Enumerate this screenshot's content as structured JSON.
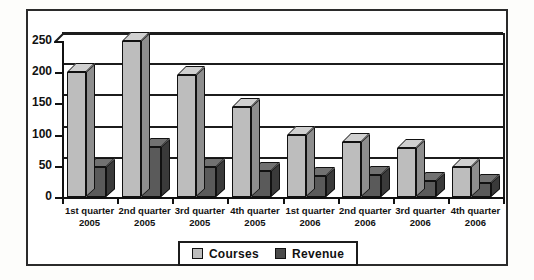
{
  "chart_data": {
    "type": "bar",
    "title": "",
    "subtitle": "",
    "xlabel": "",
    "ylabel": "",
    "ylim": [
      0,
      250
    ],
    "yticks": [
      0,
      50,
      100,
      150,
      200,
      250
    ],
    "grid": true,
    "legend_position": "bottom-center",
    "style": "3d-clustered-column",
    "categories": [
      "1st quarter 2005",
      "2nd quarter 2005",
      "3rd quarter 2005",
      "4th quarter 2005",
      "1st quarter 2006",
      "2nd quarter 2006",
      "3rd quarter 2006",
      "4th quarter 2006"
    ],
    "category_lines": [
      {
        "quarter": "1st quarter",
        "year": "2005"
      },
      {
        "quarter": "2nd quarter",
        "year": "2005"
      },
      {
        "quarter": "3rd quarter",
        "year": "2005"
      },
      {
        "quarter": "4th quarter",
        "year": "2005"
      },
      {
        "quarter": "1st quarter",
        "year": "2006"
      },
      {
        "quarter": "2nd quarter",
        "year": "2006"
      },
      {
        "quarter": "3rd quarter",
        "year": "2006"
      },
      {
        "quarter": "4th quarter",
        "year": "2006"
      }
    ],
    "series": [
      {
        "name": "Courses",
        "color": "#bdbdbd",
        "values": [
          200,
          250,
          195,
          145,
          100,
          88,
          78,
          48
        ]
      },
      {
        "name": "Revenue",
        "color": "#5a5a5a",
        "values": [
          48,
          80,
          48,
          42,
          33,
          35,
          25,
          23
        ]
      }
    ]
  },
  "legend": {
    "items": [
      {
        "label": "Courses",
        "swatch": "courses"
      },
      {
        "label": "Revenue",
        "swatch": "revenue"
      }
    ]
  },
  "colors": {
    "courses": "#bdbdbd",
    "revenue": "#5a5a5a",
    "outline": "#111111",
    "background": "#ffffff"
  }
}
